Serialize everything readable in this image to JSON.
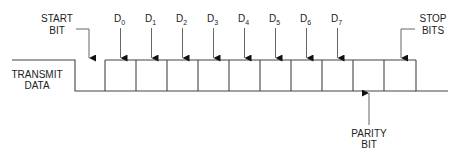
{
  "colors": {
    "line": "#444444",
    "text": "#222222",
    "background": "#ffffff"
  },
  "signal_label": [
    "TRANSMIT",
    "DATA"
  ],
  "start_bit": {
    "label": [
      "START",
      "BIT"
    ]
  },
  "stop_bits": {
    "label": [
      "STOP",
      "BITS"
    ]
  },
  "parity_bit": {
    "label": [
      "PARITY",
      "BIT"
    ]
  },
  "data_bits": [
    {
      "name": "D",
      "index": "0"
    },
    {
      "name": "D",
      "index": "1"
    },
    {
      "name": "D",
      "index": "2"
    },
    {
      "name": "D",
      "index": "3"
    },
    {
      "name": "D",
      "index": "4"
    },
    {
      "name": "D",
      "index": "5"
    },
    {
      "name": "D",
      "index": "6"
    },
    {
      "name": "D",
      "index": "7"
    }
  ],
  "geometry": {
    "high_y": 60,
    "low_y": 91,
    "idle_start_x": 12,
    "start_drop_x": 75,
    "first_box_x": 105,
    "box_width": 31,
    "box_count": 9,
    "stop_drop_x": 416,
    "end_x": 448
  }
}
